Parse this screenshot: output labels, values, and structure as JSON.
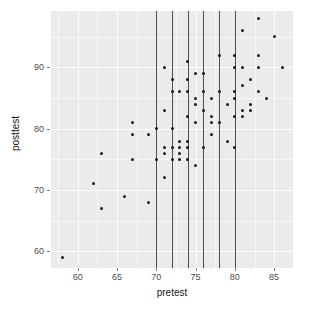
{
  "chart_data": {
    "type": "scatter",
    "title": "",
    "xlabel": "pretest",
    "ylabel": "posttest",
    "xlim": [
      56.6,
      87.4
    ],
    "ylim": [
      57.3,
      99.2
    ],
    "xticks": [
      60,
      65,
      70,
      75,
      80,
      85
    ],
    "yticks": [
      60,
      70,
      80,
      90
    ],
    "xminor": [
      57.5,
      62.5,
      67.5,
      72.5,
      77.5,
      82.5,
      87.5
    ],
    "yminor": [
      65,
      75,
      85,
      95
    ],
    "grid": true,
    "legend": "none",
    "panel_background": "#ebebeb",
    "grid_color": "#ffffff",
    "point_color": "#1a1a1a",
    "point_size": 3,
    "annotations": {
      "vertical_lines": {
        "x": [
          70,
          72,
          74,
          76,
          78,
          80
        ],
        "color": "#4d4d4d"
      }
    },
    "points": [
      [
        58,
        59
      ],
      [
        62,
        71
      ],
      [
        63,
        67
      ],
      [
        63,
        76
      ],
      [
        66,
        69
      ],
      [
        67,
        75
      ],
      [
        67,
        79
      ],
      [
        67,
        81
      ],
      [
        69,
        68
      ],
      [
        69,
        79
      ],
      [
        70,
        75
      ],
      [
        70,
        80
      ],
      [
        71,
        72
      ],
      [
        71,
        76
      ],
      [
        71,
        77
      ],
      [
        71,
        83
      ],
      [
        71,
        90
      ],
      [
        72,
        75
      ],
      [
        72,
        77
      ],
      [
        72,
        80
      ],
      [
        72,
        86
      ],
      [
        72,
        88
      ],
      [
        73,
        75
      ],
      [
        73,
        76
      ],
      [
        73,
        77
      ],
      [
        73,
        78
      ],
      [
        73,
        86
      ],
      [
        74,
        75
      ],
      [
        74,
        77
      ],
      [
        74,
        78
      ],
      [
        74,
        82
      ],
      [
        74,
        86
      ],
      [
        74,
        88
      ],
      [
        74,
        91
      ],
      [
        75,
        74
      ],
      [
        75,
        81
      ],
      [
        75,
        84
      ],
      [
        75,
        85
      ],
      [
        75,
        89
      ],
      [
        76,
        77
      ],
      [
        76,
        83
      ],
      [
        76,
        86
      ],
      [
        76,
        89
      ],
      [
        77,
        79
      ],
      [
        77,
        81
      ],
      [
        77,
        82
      ],
      [
        77,
        85
      ],
      [
        78,
        81
      ],
      [
        78,
        86
      ],
      [
        78,
        92
      ],
      [
        79,
        78
      ],
      [
        79,
        84
      ],
      [
        80,
        77
      ],
      [
        80,
        82
      ],
      [
        80,
        85
      ],
      [
        80,
        86
      ],
      [
        80,
        90
      ],
      [
        80,
        92
      ],
      [
        81,
        82
      ],
      [
        81,
        83
      ],
      [
        81,
        87
      ],
      [
        81,
        90
      ],
      [
        81,
        96
      ],
      [
        82,
        83
      ],
      [
        82,
        84
      ],
      [
        82,
        88
      ],
      [
        83,
        86
      ],
      [
        83,
        90
      ],
      [
        83,
        92
      ],
      [
        83,
        98
      ],
      [
        84,
        85
      ],
      [
        85,
        95
      ],
      [
        86,
        90
      ]
    ]
  }
}
